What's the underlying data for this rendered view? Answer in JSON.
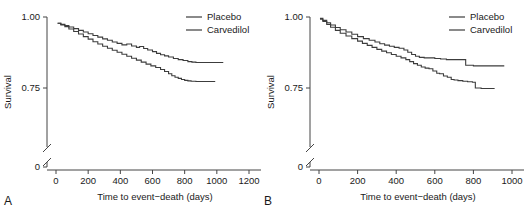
{
  "figure": {
    "panels": [
      {
        "letter": "A",
        "ylabel": "Survival",
        "xlabel": "Time to event−death (days)",
        "legend": [
          {
            "label": "Placebo",
            "color": "#3c3c3c"
          },
          {
            "label": "Carvedilol",
            "color": "#3c3c3c"
          }
        ],
        "yticks": [
          "1.00",
          "0.75",
          "0"
        ],
        "xticks": [
          "0",
          "200",
          "400",
          "600",
          "800",
          "1000",
          "1200"
        ]
      },
      {
        "letter": "B",
        "ylabel": "Survival",
        "xlabel": "Time to event−death (days)",
        "legend": [
          {
            "label": "Placebo",
            "color": "#3c3c3c"
          },
          {
            "label": "Carvedilol",
            "color": "#3c3c3c"
          }
        ],
        "yticks": [
          "1.00",
          "0.75",
          "0"
        ],
        "xticks": [
          "0",
          "200",
          "400",
          "600",
          "800",
          "1000"
        ]
      }
    ]
  },
  "chart_data": [
    {
      "type": "line",
      "title": "",
      "panel": "A",
      "xlabel": "Time to event−death (days)",
      "ylabel": "Survival",
      "xlim": [
        -120,
        1280
      ],
      "ylim": [
        0.72,
        1.005
      ],
      "y_axis_break": true,
      "y_break_between": [
        0.0,
        0.72
      ],
      "xticks": [
        0,
        200,
        400,
        600,
        800,
        1000,
        1200
      ],
      "yticks": [
        1.0,
        0.75,
        0.0
      ],
      "grid": false,
      "legend_position": "top-right",
      "series": [
        {
          "name": "Carvedilol",
          "step": "post",
          "x": [
            10,
            30,
            55,
            80,
            110,
            140,
            170,
            200,
            230,
            260,
            290,
            320,
            350,
            380,
            410,
            440,
            470,
            500,
            520,
            545,
            570,
            600,
            625,
            650,
            675,
            700,
            730,
            760,
            790,
            820,
            845,
            870,
            900,
            940,
            980,
            1040
          ],
          "y": [
            0.978,
            0.974,
            0.97,
            0.965,
            0.959,
            0.953,
            0.947,
            0.941,
            0.935,
            0.929,
            0.923,
            0.918,
            0.912,
            0.907,
            0.902,
            0.905,
            0.898,
            0.893,
            0.896,
            0.889,
            0.884,
            0.878,
            0.872,
            0.867,
            0.863,
            0.859,
            0.854,
            0.85,
            0.847,
            0.843,
            0.841,
            0.84,
            0.84,
            0.84,
            0.84,
            0.84
          ]
        },
        {
          "name": "Placebo",
          "step": "post",
          "x": [
            10,
            30,
            55,
            80,
            110,
            140,
            170,
            200,
            230,
            260,
            290,
            320,
            350,
            380,
            410,
            440,
            470,
            500,
            530,
            560,
            590,
            620,
            650,
            675,
            700,
            720,
            740,
            760,
            780,
            800,
            820,
            840,
            870,
            910,
            950,
            990
          ],
          "y": [
            0.978,
            0.972,
            0.966,
            0.958,
            0.949,
            0.94,
            0.931,
            0.922,
            0.913,
            0.905,
            0.897,
            0.89,
            0.883,
            0.876,
            0.869,
            0.862,
            0.855,
            0.848,
            0.841,
            0.834,
            0.828,
            0.822,
            0.815,
            0.808,
            0.8,
            0.793,
            0.788,
            0.784,
            0.78,
            0.777,
            0.775,
            0.774,
            0.773,
            0.773,
            0.773,
            0.773
          ]
        }
      ]
    },
    {
      "type": "line",
      "title": "",
      "panel": "B",
      "xlabel": "Time to event−death (days)",
      "ylabel": "Survival",
      "xlim": [
        -100,
        1070
      ],
      "ylim": [
        0.72,
        1.005
      ],
      "y_axis_break": true,
      "y_break_between": [
        0.0,
        0.72
      ],
      "xticks": [
        0,
        200,
        400,
        600,
        800,
        1000
      ],
      "yticks": [
        1.0,
        0.75,
        0.0
      ],
      "grid": false,
      "legend_position": "top-right",
      "series": [
        {
          "name": "Carvedilol",
          "step": "post",
          "x": [
            5,
            20,
            40,
            60,
            85,
            110,
            140,
            170,
            200,
            230,
            260,
            290,
            315,
            340,
            365,
            390,
            415,
            440,
            460,
            480,
            500,
            520,
            545,
            570,
            600,
            630,
            660,
            690,
            720,
            745,
            760,
            800,
            850,
            900,
            960
          ],
          "y": [
            0.995,
            0.988,
            0.98,
            0.972,
            0.963,
            0.955,
            0.947,
            0.939,
            0.931,
            0.924,
            0.918,
            0.912,
            0.906,
            0.901,
            0.897,
            0.893,
            0.89,
            0.884,
            0.876,
            0.868,
            0.862,
            0.858,
            0.856,
            0.856,
            0.854,
            0.852,
            0.85,
            0.85,
            0.85,
            0.85,
            0.83,
            0.828,
            0.828,
            0.828,
            0.828
          ]
        },
        {
          "name": "Placebo",
          "step": "post",
          "x": [
            5,
            20,
            40,
            60,
            85,
            110,
            140,
            170,
            200,
            225,
            250,
            275,
            300,
            325,
            350,
            375,
            400,
            425,
            450,
            470,
            490,
            510,
            530,
            550,
            570,
            590,
            610,
            625,
            645,
            665,
            685,
            700,
            720,
            745,
            770,
            795,
            810,
            840,
            880,
            910
          ],
          "y": [
            0.992,
            0.984,
            0.974,
            0.964,
            0.953,
            0.943,
            0.933,
            0.924,
            0.915,
            0.907,
            0.9,
            0.893,
            0.886,
            0.88,
            0.874,
            0.868,
            0.862,
            0.856,
            0.85,
            0.843,
            0.836,
            0.83,
            0.824,
            0.82,
            0.818,
            0.81,
            0.802,
            0.8,
            0.792,
            0.788,
            0.78,
            0.778,
            0.776,
            0.774,
            0.772,
            0.77,
            0.75,
            0.748,
            0.748,
            0.748
          ]
        }
      ]
    }
  ]
}
